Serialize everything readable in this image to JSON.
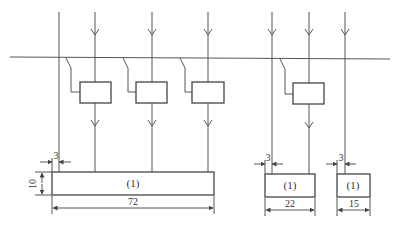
{
  "diagram": {
    "bar_labels": [
      "(1)",
      "(1)",
      "(1)"
    ],
    "dimensions": {
      "bar1_width": "72",
      "bar2_width": "22",
      "bar3_width": "15",
      "bar_height": "10",
      "offset1": "3",
      "offset2": "3",
      "offset3": "3"
    }
  }
}
